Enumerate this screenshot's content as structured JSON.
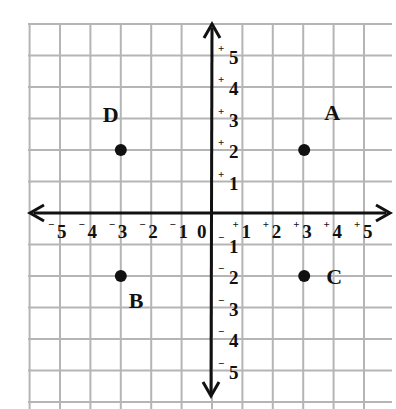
{
  "diagram": {
    "type": "coordinate-plane",
    "colors": {
      "grid": "#b5b5b5",
      "axis": "#111111",
      "point": "#111111",
      "background": "#ffffff"
    },
    "grid": {
      "x0": 28,
      "y0": 24,
      "cell": 30.6,
      "cols": 12,
      "rows": 13,
      "origin_px": [
        212,
        213
      ]
    },
    "x_ticks": [
      {
        "value": -5,
        "sign": "−",
        "num": "5"
      },
      {
        "value": -4,
        "sign": "−",
        "num": "4"
      },
      {
        "value": -3,
        "sign": "−",
        "num": "3"
      },
      {
        "value": -2,
        "sign": "−",
        "num": "2"
      },
      {
        "value": -1,
        "sign": "−",
        "num": "1"
      },
      {
        "value": 0,
        "sign": "",
        "num": "0"
      },
      {
        "value": 1,
        "sign": "+",
        "num": "1"
      },
      {
        "value": 2,
        "sign": "+",
        "num": "2"
      },
      {
        "value": 3,
        "sign": "+",
        "num": "3"
      },
      {
        "value": 4,
        "sign": "+",
        "num": "4"
      },
      {
        "value": 5,
        "sign": "+",
        "num": "5"
      }
    ],
    "y_ticks": [
      {
        "value": 5,
        "sign": "+",
        "num": "5"
      },
      {
        "value": 4,
        "sign": "+",
        "num": "4"
      },
      {
        "value": 3,
        "sign": "+",
        "num": "3"
      },
      {
        "value": 2,
        "sign": "+",
        "num": "2"
      },
      {
        "value": 1,
        "sign": "+",
        "num": "1"
      },
      {
        "value": -1,
        "sign": "−",
        "num": "1"
      },
      {
        "value": -2,
        "sign": "−",
        "num": "2"
      },
      {
        "value": -3,
        "sign": "−",
        "num": "3"
      },
      {
        "value": -4,
        "sign": "−",
        "num": "4"
      },
      {
        "value": -5,
        "sign": "−",
        "num": "5"
      }
    ],
    "points": [
      {
        "label": "A",
        "x": 3,
        "y": 2
      },
      {
        "label": "B",
        "x": -3,
        "y": -2
      },
      {
        "label": "C",
        "x": 3,
        "y": -2
      },
      {
        "label": "D",
        "x": -3,
        "y": 2
      }
    ]
  }
}
